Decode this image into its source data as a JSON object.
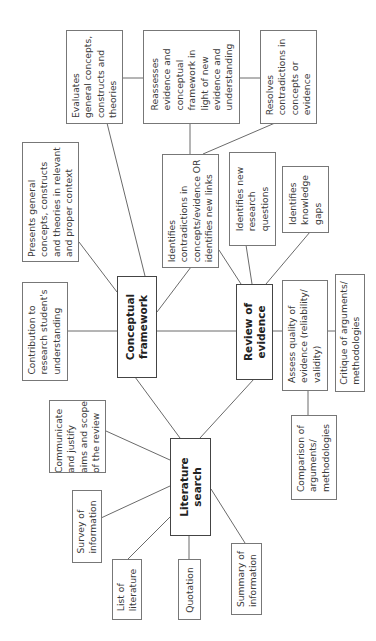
{
  "diagram": {
    "type": "concept-map",
    "orientation": "rotated-90-ccw",
    "hubs": {
      "conceptual_framework": "Conceptual\nframework",
      "review_of_evidence": "Review of\nevidence",
      "literature_search": "Literature\nsearch"
    },
    "nodes": {
      "evaluates": "Evaluates\ngeneral concepts,\nconstructs and\ntheories",
      "reassesses": "Reassesses\nevidence and\nconceptual\nframework in\nlight of new\nevidence and\nunderstanding",
      "resolves": "Resolves\ncontradictions in\nconcepts or\nevidence",
      "presents": "Presents general\nconcepts, constructs\nand theories in relevant\nand proper context",
      "identifies_contradictions": "Identifies\ncontradictions in\nconcepts/evidence OR\nidentifies new links",
      "identifies_questions": "Identifies new\nresearch\nquestions",
      "identifies_gaps": "Identifies\nknowledge\ngaps",
      "contribution": "Contribution to\nresearch student's\nunderstanding",
      "assess_quality": "Assess quality of\nevidence (reliability/\nvalidity)",
      "critique": "Critique of arguments/\nmethodologies",
      "comparison": "Comparison of\narguments/\nmethodologies",
      "communicate": "Communicate\nand justify\naims and scope\nof the review",
      "survey": "Survey of\ninformation",
      "list_literature": "List of\nliterature",
      "quotation": "Quotation",
      "summary": "Summary of\ninformation"
    },
    "edges": [
      [
        "conceptual_framework",
        "review_of_evidence"
      ],
      [
        "conceptual_framework",
        "literature_search"
      ],
      [
        "review_of_evidence",
        "literature_search"
      ],
      [
        "conceptual_framework",
        "contribution"
      ],
      [
        "conceptual_framework",
        "presents"
      ],
      [
        "conceptual_framework",
        "evaluates"
      ],
      [
        "conceptual_framework",
        "identifies_contradictions"
      ],
      [
        "evaluates",
        "reassesses"
      ],
      [
        "reassesses",
        "resolves"
      ],
      [
        "reassesses",
        "identifies_contradictions"
      ],
      [
        "resolves",
        "identifies_contradictions"
      ],
      [
        "review_of_evidence",
        "identifies_contradictions"
      ],
      [
        "review_of_evidence",
        "identifies_questions"
      ],
      [
        "review_of_evidence",
        "identifies_gaps"
      ],
      [
        "review_of_evidence",
        "assess_quality"
      ],
      [
        "assess_quality",
        "critique"
      ],
      [
        "assess_quality",
        "comparison"
      ],
      [
        "literature_search",
        "communicate"
      ],
      [
        "literature_search",
        "survey"
      ],
      [
        "literature_search",
        "list_literature"
      ],
      [
        "literature_search",
        "quotation"
      ],
      [
        "literature_search",
        "summary"
      ]
    ]
  }
}
